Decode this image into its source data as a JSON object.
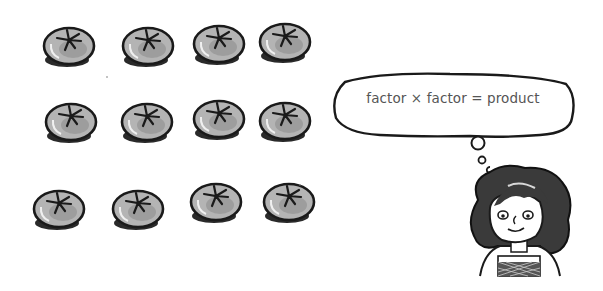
{
  "scene": {
    "description": "Hand-drawn illustration of a 3 by 4 array of tomatoes and a girl with a thought bubble",
    "array": {
      "rows": 3,
      "columns": 4,
      "item": "tomato",
      "total": 12
    },
    "thought_bubble": {
      "text": "factor × factor = product"
    },
    "character": "girl-with-curly-hair"
  },
  "colors": {
    "background": "#ffffff",
    "outline": "#1a1a1a",
    "tomato_fill": "#a8a8a8",
    "tomato_shadow": "#2a2a2a",
    "text": "#555555"
  }
}
